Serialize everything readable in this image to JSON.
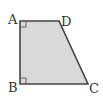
{
  "diagram": {
    "type": "geometry",
    "shape": "right-trapezoid",
    "fill_color": "#d9d9d9",
    "stroke_color": "#444444",
    "vertices": [
      {
        "label": "A",
        "x": 20,
        "y": 21
      },
      {
        "label": "D",
        "x": 59,
        "y": 21
      },
      {
        "label": "C",
        "x": 88,
        "y": 84
      },
      {
        "label": "B",
        "x": 20,
        "y": 84
      }
    ],
    "right_angles": [
      "A",
      "B"
    ],
    "labels": {
      "A": "A",
      "B": "B",
      "C": "C",
      "D": "D"
    }
  }
}
